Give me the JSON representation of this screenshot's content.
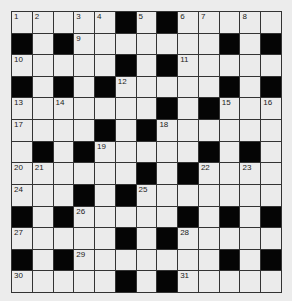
{
  "puzzle": {
    "rows": 13,
    "cols": 13,
    "colors": {
      "background": "#ececec",
      "cell": "#ebebeb",
      "block": "#050505",
      "line": "#333333"
    },
    "grid": [
      [
        "1",
        "2",
        ".",
        "3",
        "4",
        "#",
        "5",
        "#",
        "6",
        "7",
        ".",
        "8",
        "."
      ],
      [
        "#",
        ".",
        "#",
        "9",
        ".",
        ".",
        ".",
        ".",
        ".",
        ".",
        "#",
        ".",
        "#"
      ],
      [
        "10",
        ".",
        ".",
        ".",
        ".",
        "#",
        ".",
        "#",
        "11",
        ".",
        ".",
        ".",
        "."
      ],
      [
        "#",
        ".",
        "#",
        ".",
        "#",
        "12",
        ".",
        ".",
        ".",
        ".",
        "#",
        ".",
        "#"
      ],
      [
        "13",
        ".",
        "14",
        ".",
        ".",
        ".",
        ".",
        "#",
        ".",
        "#",
        "15",
        ".",
        "16"
      ],
      [
        "17",
        ".",
        ".",
        ".",
        "#",
        ".",
        "#",
        "18",
        ".",
        ".",
        ".",
        ".",
        "."
      ],
      [
        ".",
        "#",
        ".",
        "#",
        "19",
        ".",
        ".",
        ".",
        ".",
        "#",
        ".",
        "#",
        "."
      ],
      [
        "20",
        "21",
        ".",
        ".",
        ".",
        ".",
        "#",
        ".",
        "#",
        "22",
        ".",
        "23",
        "."
      ],
      [
        "24",
        ".",
        ".",
        "#",
        ".",
        "#",
        "25",
        ".",
        ".",
        ".",
        ".",
        ".",
        "."
      ],
      [
        "#",
        ".",
        "#",
        "26",
        ".",
        ".",
        ".",
        ".",
        "#",
        ".",
        "#",
        ".",
        "#"
      ],
      [
        "27",
        ".",
        ".",
        ".",
        ".",
        "#",
        ".",
        "#",
        "28",
        ".",
        ".",
        ".",
        "."
      ],
      [
        "#",
        ".",
        "#",
        "29",
        ".",
        ".",
        ".",
        ".",
        ".",
        ".",
        "#",
        ".",
        "#"
      ],
      [
        "30",
        ".",
        ".",
        ".",
        ".",
        "#",
        ".",
        "#",
        "31",
        ".",
        ".",
        ".",
        "."
      ]
    ]
  }
}
